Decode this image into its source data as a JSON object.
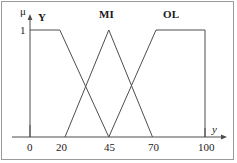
{
  "figure": {
    "axis_y_label": "μ",
    "axis_x_label": "y",
    "y_axis_max_tick": "1"
  },
  "chart_data": {
    "type": "line",
    "title": "",
    "subtitle": "",
    "xlabel": "y",
    "ylabel": "μ",
    "xlim": [
      0,
      100
    ],
    "ylim": [
      0,
      1
    ],
    "grid": false,
    "legend_position": "inline-above-curves",
    "x_ticks": [
      0,
      20,
      45,
      70,
      100
    ],
    "x_tick_labels": [
      "0",
      "20",
      "45",
      "70",
      "100"
    ],
    "y_ticks": [
      1
    ],
    "y_tick_labels": [
      "1"
    ],
    "line_color": "#4d4d4d",
    "series": [
      {
        "name": "Y",
        "shape": "trapezoid",
        "label": "Y",
        "label_x": 13,
        "points": [
          [
            0,
            1
          ],
          [
            17,
            1
          ],
          [
            45,
            0
          ]
        ]
      },
      {
        "name": "MI",
        "shape": "triangle",
        "label": "MI",
        "label_x": 45,
        "points": [
          [
            20,
            0
          ],
          [
            45,
            1
          ],
          [
            70,
            0
          ]
        ]
      },
      {
        "name": "OL",
        "shape": "trapezoid",
        "label": "OL",
        "label_x": 76,
        "points": [
          [
            45,
            0
          ],
          [
            72,
            1
          ],
          [
            100,
            1
          ],
          [
            100,
            0
          ]
        ]
      }
    ],
    "annotations": [
      {
        "text": "Y",
        "x": 13,
        "y": 1.1
      },
      {
        "text": "MI",
        "x": 45,
        "y": 1.15
      },
      {
        "text": "OL",
        "x": 76,
        "y": 1.15
      }
    ]
  }
}
